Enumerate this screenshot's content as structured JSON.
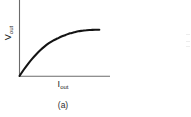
{
  "figure": {
    "caption": "(a)",
    "background_color": "#ffffff",
    "curve_color": "#141414",
    "axis_color": "#6b6b6b"
  },
  "axis_labels": {
    "y_symbol": "V",
    "y_subscript": "out",
    "x_symbol": "I",
    "x_subscript": "out"
  },
  "chart_data": {
    "type": "line",
    "title": "",
    "subtitle": "",
    "xlabel": "I_out",
    "ylabel": "V_out",
    "xlim": [
      0,
      1
    ],
    "ylim": [
      0,
      1
    ],
    "grid": false,
    "legend": false,
    "legend_position": "none",
    "xticks": [],
    "yticks": [],
    "xticklabels": [],
    "yticklabels": [],
    "annotations": [
      "(a)"
    ],
    "series": [
      {
        "name": "V_out vs I_out",
        "shape": "saturating / concave-down rising curve from origin",
        "x": [
          0.0,
          0.05,
          0.1,
          0.15,
          0.2,
          0.25,
          0.3,
          0.35,
          0.4,
          0.45,
          0.5,
          0.55,
          0.6,
          0.65,
          0.7,
          0.75,
          0.8,
          0.85,
          0.9,
          0.95
        ],
        "y": [
          0.0,
          0.12,
          0.23,
          0.33,
          0.42,
          0.5,
          0.57,
          0.63,
          0.68,
          0.72,
          0.76,
          0.79,
          0.82,
          0.84,
          0.86,
          0.87,
          0.88,
          0.885,
          0.89,
          0.89
        ]
      }
    ]
  }
}
